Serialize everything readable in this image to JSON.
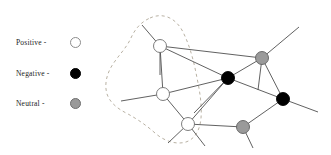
{
  "figure": {
    "width": 331,
    "height": 155,
    "background": "#ffffff"
  },
  "legend": {
    "items": [
      {
        "label": "Positive -",
        "swatch": "open-circle-white",
        "color": "#ffffff",
        "stroke": "#8c8c8c",
        "sign": "positive"
      },
      {
        "label": "Negative -",
        "swatch": "filled-circle-black",
        "color": "#000000",
        "stroke": "#000000",
        "sign": "negative"
      },
      {
        "label": "Neutral -",
        "swatch": "filled-circle-gray",
        "color": "#9a9a9a",
        "stroke": "#6f6f6f",
        "sign": "neutral"
      }
    ]
  },
  "graph": {
    "node_radius": 6.5,
    "edge_color": "#4f4f4f",
    "edge_width": 0.9,
    "boundary": {
      "style": "dashed",
      "color": "#b0a898",
      "width": 0.9,
      "dash": "3 3",
      "path": "M 150 18 C 163 12, 176 18, 183 32 C 190 46, 194 62, 197 78 C 200 92, 202 106, 201 118 C 200 130, 195 139, 186 142 C 176 145, 164 141, 155 133 C 146 125, 137 119, 128 114 C 118 109, 110 103, 107 94 C 104 84, 107 73, 113 64 C 119 55, 126 48, 130 40 C 134 31, 139 23, 150 18 Z"
    },
    "nodes": [
      {
        "id": "n1",
        "cx": 160,
        "cy": 46,
        "type": "positive"
      },
      {
        "id": "n2",
        "cx": 163,
        "cy": 94,
        "type": "positive"
      },
      {
        "id": "n3",
        "cx": 188,
        "cy": 124,
        "type": "positive"
      },
      {
        "id": "n4",
        "cx": 262,
        "cy": 58,
        "type": "neutral"
      },
      {
        "id": "n5",
        "cx": 228,
        "cy": 78,
        "type": "negative"
      },
      {
        "id": "n6",
        "cx": 283,
        "cy": 99,
        "type": "negative"
      },
      {
        "id": "n7",
        "cx": 243,
        "cy": 127,
        "type": "neutral"
      }
    ],
    "edges": [
      {
        "from": "n1",
        "to": "n2"
      },
      {
        "from": "n1",
        "to": "n4"
      },
      {
        "from": "n1",
        "to": "n5"
      },
      {
        "from": "n2",
        "to": "n3"
      },
      {
        "from": "n2",
        "to": "n5"
      },
      {
        "from": "n3",
        "to": "n5"
      },
      {
        "from": "n3",
        "to": "n7"
      },
      {
        "from": "n4",
        "to": "n5"
      },
      {
        "from": "n4",
        "to": "n6"
      },
      {
        "from": "n5",
        "to": "n6"
      },
      {
        "from": "n6",
        "to": "n7"
      }
    ],
    "stub_edges": [
      {
        "from": "n1",
        "x2": 142,
        "y2": 25
      },
      {
        "from": "n1",
        "x2": 160,
        "y2": 75
      },
      {
        "from": "n2",
        "x2": 121,
        "y2": 101
      },
      {
        "from": "n3",
        "x2": 168,
        "y2": 143
      },
      {
        "from": "n3",
        "x2": 205,
        "y2": 146
      },
      {
        "from": "n4",
        "x2": 299,
        "y2": 27
      },
      {
        "from": "n4",
        "x2": 258,
        "y2": 90
      },
      {
        "from": "n6",
        "x2": 318,
        "y2": 112
      },
      {
        "from": "n7",
        "x2": 253,
        "y2": 148
      },
      {
        "from": "n5",
        "x2": 194,
        "y2": 113
      }
    ]
  }
}
